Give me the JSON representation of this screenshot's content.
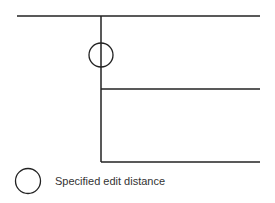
{
  "diagram": {
    "type": "branching-tree",
    "line_color": "#222222",
    "trunk": {
      "x": 101,
      "y1": 16,
      "y2": 162
    },
    "branches": [
      {
        "name": "top-branch",
        "x1": 17,
        "x2": 260,
        "y": 16
      },
      {
        "name": "middle-branch",
        "x1": 101,
        "x2": 260,
        "y": 89
      },
      {
        "name": "bottom-branch",
        "x1": 101,
        "x2": 260,
        "y": 162
      }
    ],
    "markers": [
      {
        "name": "edit-distance-marker",
        "cx": 101,
        "cy": 55,
        "r": 12
      }
    ]
  },
  "legend": {
    "symbol": "circle",
    "label": "Specified edit distance"
  }
}
